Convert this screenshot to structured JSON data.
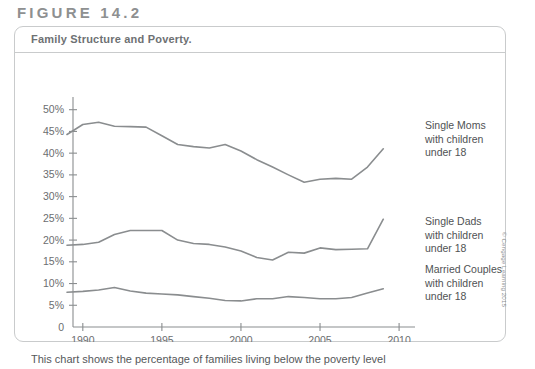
{
  "figure": {
    "label": "FIGURE 14.2",
    "title": "Family Structure and Poverty.",
    "caption": "This chart shows the percentage of families living below the poverty level",
    "copyright": "© Cengage Learning 2015"
  },
  "colors": {
    "line": "#8a8d8f",
    "axis": "#8a8d8f",
    "border": "#c9cbcc",
    "label_text": "#6b6e70",
    "title_text": "#6e7173",
    "figure_text": "#8e9091"
  },
  "chart_data": {
    "type": "line",
    "title": "Family Structure and Poverty.",
    "xlabel": "",
    "ylabel": "",
    "xlim": [
      1989,
      2010.5
    ],
    "ylim": [
      0,
      52
    ],
    "grid": false,
    "legend_position": "right-inline",
    "x_ticks": [
      "1990",
      "1995",
      "2000",
      "2005",
      "2010"
    ],
    "x_tick_values": [
      1990,
      1995,
      2000,
      2005,
      2010
    ],
    "y_ticks": [
      "0",
      "5%",
      "10%",
      "15%",
      "20%",
      "25%",
      "30%",
      "35%",
      "40%",
      "45%",
      "50%"
    ],
    "y_tick_values": [
      0,
      5,
      10,
      15,
      20,
      25,
      30,
      35,
      40,
      45,
      50
    ],
    "x": [
      1989,
      1990,
      1991,
      1992,
      1993,
      1994,
      1995,
      1996,
      1997,
      1998,
      1999,
      2000,
      2001,
      2002,
      2003,
      2004,
      2005,
      2006,
      2007,
      2008,
      2009
    ],
    "series": [
      {
        "name": "Single Moms with children under 18",
        "label_lines": [
          "Single Moms",
          "with children",
          "under 18"
        ],
        "values": [
          44.3,
          46.6,
          47.1,
          46.2,
          46.1,
          46.0,
          44.0,
          42.0,
          41.5,
          41.2,
          42.0,
          40.5,
          38.5,
          36.8,
          35.0,
          33.3,
          34.0,
          34.2,
          34.0,
          36.8,
          41.0
        ]
      },
      {
        "name": "Single Dads with children under 18",
        "label_lines": [
          "Single Dads",
          "with children",
          "under 18"
        ],
        "values": [
          18.8,
          19.0,
          19.5,
          21.3,
          22.2,
          22.2,
          22.2,
          20.0,
          19.2,
          19.0,
          18.4,
          17.5,
          16.0,
          15.4,
          17.2,
          17.0,
          18.2,
          17.8,
          17.9,
          18.0,
          24.8
        ]
      },
      {
        "name": "Married Couples with children under 18",
        "label_lines": [
          "Married Couples",
          "with children",
          "under 18"
        ],
        "values": [
          8.0,
          8.2,
          8.5,
          9.1,
          8.3,
          7.8,
          7.6,
          7.4,
          7.0,
          6.6,
          6.1,
          6.0,
          6.5,
          6.5,
          7.0,
          6.8,
          6.5,
          6.5,
          6.8,
          7.8,
          8.8
        ]
      }
    ]
  }
}
